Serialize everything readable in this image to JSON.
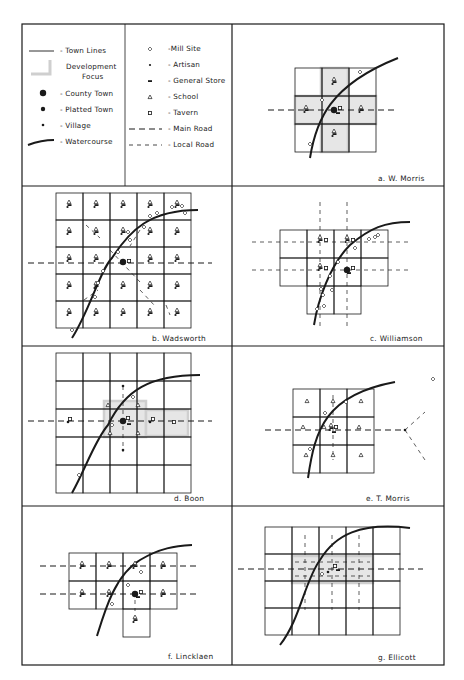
{
  "figure": {
    "frame": {
      "left": 22,
      "top": 24,
      "right": 444,
      "bottom": 665,
      "col_divider": 232,
      "row_dividers": [
        186,
        346,
        506
      ],
      "legend_divider": 125
    },
    "colors": {
      "ink": "#1a1a1a",
      "focus": "#cfcfcf",
      "paper": "#ffffff"
    }
  },
  "legend": {
    "left": [
      {
        "symbol": "town-line",
        "label": "- Town Lines"
      },
      {
        "symbol": "development-focus",
        "label": "Development",
        "label2": "Focus"
      },
      {
        "symbol": "county-town",
        "label": "- County Town"
      },
      {
        "symbol": "platted-town",
        "label": "- Platted Town"
      },
      {
        "symbol": "village",
        "label": "- Village"
      },
      {
        "symbol": "watercourse",
        "label": "- Watercourse"
      }
    ],
    "right": [
      {
        "symbol": "mill-site",
        "label": "-Mill Site"
      },
      {
        "symbol": "artisan",
        "label": "- Artisan"
      },
      {
        "symbol": "general-store",
        "label": "- General Store"
      },
      {
        "symbol": "school",
        "label": "- School"
      },
      {
        "symbol": "tavern",
        "label": "- Tavern"
      },
      {
        "symbol": "main-road",
        "label": "- Main Road"
      },
      {
        "symbol": "local-road",
        "label": "- Local Road"
      }
    ]
  },
  "panels": [
    {
      "id": "a",
      "caption": "a.  W. Morris"
    },
    {
      "id": "b",
      "caption": "b.  Wadsworth"
    },
    {
      "id": "c",
      "caption": "c.  Williamson"
    },
    {
      "id": "d",
      "caption": "d.  Boon"
    },
    {
      "id": "e",
      "caption": "e.  T. Morris"
    },
    {
      "id": "f",
      "caption": "f.  Lincklaen"
    },
    {
      "id": "g",
      "caption": "g.  Ellicott"
    }
  ],
  "maps": {
    "a": {
      "grid": {
        "x": 295,
        "y": 68,
        "cols": 3,
        "rows": 3,
        "cw": 27,
        "ch": 28
      },
      "focus": [
        [
          321,
          68,
          27,
          84
        ],
        [
          295,
          96,
          81,
          28
        ]
      ],
      "watercourse": "M310,158 C316,120 330,85 398,58",
      "main_roads": [
        [
          268,
          110,
          398,
          110
        ]
      ],
      "local_roads": [],
      "county_town": [
        [
          334,
          110
        ]
      ],
      "villages": [],
      "tavern": [
        [
          340,
          108
        ]
      ],
      "general_store": [
        [
          338,
          113
        ]
      ],
      "artisan_clusters": [
        [
          334,
          82
        ],
        [
          306,
          110
        ],
        [
          361,
          110
        ],
        [
          334,
          134
        ]
      ],
      "mills": [
        [
          360,
          72
        ],
        [
          322,
          100
        ],
        [
          310,
          144
        ]
      ],
      "schools": []
    },
    "b": {
      "grid": {
        "x": 56,
        "y": 193,
        "cols": 5,
        "rows": 5,
        "cw": 27,
        "ch": 27
      },
      "focus": [],
      "watercourse": "M72,338 C90,310 100,270 112,258 C130,230 150,210 198,210",
      "main_roads": [
        [
          28,
          263,
          212,
          263
        ]
      ],
      "local_roads": [
        [
          86,
          225,
          100,
          238
        ],
        [
          110,
          250,
          140,
          282
        ],
        [
          140,
          230,
          130,
          246
        ],
        [
          140,
          290,
          155,
          306
        ],
        [
          84,
          300,
          98,
          290
        ],
        [
          166,
          305,
          170,
          315
        ]
      ],
      "county_town": [
        [
          123,
          262
        ]
      ],
      "villages": [],
      "tavern": [
        [
          129,
          261
        ]
      ],
      "general_store": [],
      "artisan_clusters": [
        [
          69,
          205
        ],
        [
          96,
          205
        ],
        [
          123,
          205
        ],
        [
          150,
          205
        ],
        [
          177,
          205
        ],
        [
          69,
          232
        ],
        [
          96,
          232
        ],
        [
          123,
          232
        ],
        [
          150,
          232
        ],
        [
          177,
          232
        ],
        [
          69,
          259
        ],
        [
          96,
          259
        ],
        [
          150,
          259
        ],
        [
          177,
          259
        ],
        [
          69,
          286
        ],
        [
          96,
          286
        ],
        [
          123,
          286
        ],
        [
          150,
          286
        ],
        [
          177,
          286
        ],
        [
          69,
          313
        ],
        [
          96,
          313
        ],
        [
          123,
          313
        ],
        [
          150,
          313
        ],
        [
          177,
          313
        ]
      ],
      "mills": [
        [
          172,
          207
        ],
        [
          185,
          213
        ],
        [
          157,
          213
        ],
        [
          150,
          216
        ],
        [
          144,
          227
        ],
        [
          128,
          232
        ],
        [
          130,
          240
        ],
        [
          118,
          252
        ],
        [
          103,
          271
        ],
        [
          98,
          283
        ],
        [
          95,
          297
        ],
        [
          72,
          330
        ],
        [
          182,
          206
        ]
      ],
      "schools": []
    },
    "c": {
      "grid": {
        "x": 280,
        "y": 230,
        "cols": 4,
        "rows": 2,
        "cw": 27,
        "ch": 28,
        "extra": [
          [
            307,
            286,
            27,
            28
          ],
          [
            334,
            286,
            27,
            28
          ]
        ]
      },
      "focus": [],
      "watercourse": "M314,325 C318,300 330,265 350,245 C370,228 385,222 410,222",
      "main_roads": [],
      "local_roads": [
        [
          252,
          242,
          410,
          242
        ],
        [
          252,
          270,
          410,
          270
        ],
        [
          320,
          202,
          320,
          330
        ],
        [
          347,
          202,
          347,
          330
        ]
      ],
      "county_town": [
        [
          347,
          270
        ]
      ],
      "villages": [],
      "tavern": [
        [
          326,
          240
        ],
        [
          353,
          240
        ],
        [
          326,
          268
        ],
        [
          353,
          268
        ]
      ],
      "general_store": [
        [
          349,
          273
        ]
      ],
      "artisan_clusters": [
        [
          320,
          240
        ],
        [
          347,
          240
        ],
        [
          320,
          268
        ]
      ],
      "mills": [
        [
          369,
          239
        ],
        [
          375,
          237
        ],
        [
          378,
          235
        ],
        [
          355,
          248
        ],
        [
          338,
          262
        ],
        [
          330,
          276
        ],
        [
          321,
          289
        ],
        [
          332,
          290
        ],
        [
          323,
          295
        ],
        [
          317,
          309
        ],
        [
          324,
          306
        ]
      ],
      "schools": []
    },
    "d": {
      "grid": {
        "x": 56,
        "y": 353,
        "cols": 5,
        "rows": 5,
        "cw": 27,
        "ch": 28
      },
      "focus": [
        [
          104,
          401,
          42,
          36
        ],
        [
          146,
          410,
          42,
          26
        ]
      ],
      "watercourse": "M72,493 C85,470 95,440 108,425 C125,390 150,375 200,375",
      "main_roads": [
        [
          28,
          421,
          212,
          421
        ]
      ],
      "local_roads": [
        [
          123,
          386,
          123,
          452
        ]
      ],
      "county_town": [
        [
          123,
          421
        ]
      ],
      "villages": [
        [
          123,
          386
        ],
        [
          123,
          450
        ],
        [
          68,
          422
        ],
        [
          150,
          422
        ]
      ],
      "tavern": [
        [
          70,
          419
        ],
        [
          128,
          418
        ],
        [
          153,
          419
        ],
        [
          174,
          422
        ]
      ],
      "general_store": [
        [
          129,
          424
        ]
      ],
      "artisan_clusters": [],
      "mills": [
        [
          133,
          397
        ],
        [
          112,
          425
        ],
        [
          79,
          475
        ]
      ],
      "schools": [
        [
          108,
          405
        ],
        [
          138,
          405
        ],
        [
          110,
          433
        ],
        [
          138,
          433
        ]
      ]
    },
    "e": {
      "grid": {
        "x": 293,
        "y": 389,
        "cols": 3,
        "rows": 3,
        "cw": 27,
        "ch": 28
      },
      "focus": [],
      "watercourse": "M308,478 C315,430 325,395 395,382",
      "main_roads": [
        [
          265,
          430,
          405,
          430
        ]
      ],
      "local_roads": [
        [
          333,
          395,
          333,
          460
        ],
        [
          405,
          430,
          425,
          412
        ],
        [
          405,
          430,
          425,
          460
        ]
      ],
      "county_town": [],
      "villages": [
        [
          405,
          430
        ]
      ],
      "tavern": [
        [
          336,
          427
        ]
      ],
      "general_store": [
        [
          334,
          432
        ]
      ],
      "artisan_clusters": [
        [
          331,
          428
        ]
      ],
      "mills": [
        [
          325,
          413
        ],
        [
          346,
          402
        ],
        [
          310,
          449
        ]
      ],
      "schools": [
        [
          307,
          401
        ],
        [
          333,
          401
        ],
        [
          361,
          401
        ],
        [
          303,
          427
        ],
        [
          324,
          427
        ],
        [
          359,
          427
        ],
        [
          306,
          455
        ],
        [
          333,
          455
        ],
        [
          361,
          455
        ]
      ],
      "mill_extra": [
        [
          433,
          379
        ]
      ]
    },
    "f": {
      "grid": {
        "x": 69,
        "y": 553,
        "cols": 4,
        "rows": 2,
        "cw": 27,
        "ch": 28,
        "extra": [
          [
            123,
            609,
            27,
            28
          ]
        ]
      },
      "focus": [],
      "watercourse": "M97,636 C105,610 115,575 140,560 C160,548 175,546 192,545",
      "main_roads": [
        [
          40,
          566,
          196,
          566
        ],
        [
          40,
          594,
          196,
          594
        ]
      ],
      "local_roads": [
        [
          135,
          600,
          135,
          611
        ]
      ],
      "county_town": [
        [
          135,
          594
        ]
      ],
      "villages": [],
      "tavern": [
        [
          141,
          592
        ]
      ],
      "general_store": [
        [
          138,
          597
        ]
      ],
      "artisan_clusters": [
        [
          82,
          566
        ],
        [
          109,
          566
        ],
        [
          135,
          566
        ],
        [
          163,
          566
        ],
        [
          82,
          594
        ],
        [
          109,
          594
        ],
        [
          163,
          594
        ],
        [
          135,
          620
        ]
      ],
      "mills": [
        [
          141,
          572
        ],
        [
          128,
          585
        ],
        [
          112,
          604
        ]
      ],
      "schools": []
    },
    "g": {
      "grid": {
        "x": 265,
        "y": 527,
        "cols": 5,
        "rows": 4,
        "cw": 27,
        "ch": 27
      },
      "focus": [
        [
          292,
          556,
          81,
          27
        ]
      ],
      "watercourse": "M280,645 C300,620 305,580 320,560 C335,535 360,522 410,528",
      "main_roads": [
        [
          238,
          569,
          423,
          569
        ]
      ],
      "local_roads": [
        [
          305,
          535,
          305,
          610
        ],
        [
          332,
          535,
          332,
          610
        ],
        [
          359,
          535,
          359,
          610
        ],
        [
          295,
          562,
          370,
          562
        ],
        [
          295,
          576,
          370,
          576
        ]
      ],
      "county_town": [],
      "villages": [
        [
          328,
          572
        ]
      ],
      "tavern": [
        [
          335,
          566
        ]
      ],
      "general_store": [
        [
          338,
          570
        ]
      ],
      "artisan_clusters": [],
      "mills": [
        [
          322,
          574
        ]
      ],
      "schools": []
    }
  }
}
